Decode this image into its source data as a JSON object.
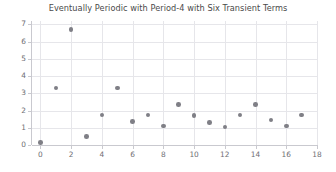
{
  "chart_data": {
    "type": "scatter",
    "title": "Eventually Periodic with Period-4 with Six Transient Terms",
    "xlabel": "",
    "ylabel": "",
    "xlim": [
      -0.55,
      18.0
    ],
    "ylim": [
      0.0,
      7.2
    ],
    "grid": true,
    "legend": null,
    "marker_color": "#7f7f86",
    "grid_color": "#e6e6ea",
    "axis_color": "#c9c9cf",
    "title_color": "#4a4a4a",
    "tick_color": "#6e6e73",
    "xticks": [
      0,
      2,
      4,
      6,
      8,
      10,
      12,
      14,
      16,
      18
    ],
    "xtick_labels": [
      "0",
      "2",
      "4",
      "6",
      "8",
      "10",
      "12",
      "14",
      "16",
      "18"
    ],
    "yticks": [
      0,
      1,
      2,
      3,
      4,
      5,
      6,
      7
    ],
    "ytick_labels": [
      "0",
      "1",
      "2",
      "3",
      "4",
      "5",
      "6",
      "7"
    ],
    "x": [
      0,
      1,
      2,
      3,
      4,
      5,
      6,
      7,
      8,
      9,
      10,
      11,
      12,
      13,
      14,
      15,
      16,
      17
    ],
    "y": [
      0.15,
      3.3,
      6.7,
      0.5,
      1.75,
      3.3,
      1.35,
      1.75,
      1.1,
      2.35,
      1.7,
      1.3,
      1.05,
      1.75,
      2.35,
      1.45,
      1.1,
      1.75
    ],
    "points": [
      {
        "x": 0,
        "y": 0.15
      },
      {
        "x": 1,
        "y": 3.3
      },
      {
        "x": 2,
        "y": 6.7
      },
      {
        "x": 3,
        "y": 0.5
      },
      {
        "x": 4,
        "y": 1.75
      },
      {
        "x": 5,
        "y": 3.3
      },
      {
        "x": 6,
        "y": 1.35
      },
      {
        "x": 7,
        "y": 1.75
      },
      {
        "x": 8,
        "y": 1.1
      },
      {
        "x": 9,
        "y": 2.35
      },
      {
        "x": 10,
        "y": 1.7
      },
      {
        "x": 11,
        "y": 1.3
      },
      {
        "x": 12,
        "y": 1.05
      },
      {
        "x": 13,
        "y": 1.75
      },
      {
        "x": 14,
        "y": 2.35
      },
      {
        "x": 15,
        "y": 1.45
      },
      {
        "x": 16,
        "y": 1.1
      },
      {
        "x": 17,
        "y": 1.75
      }
    ]
  }
}
